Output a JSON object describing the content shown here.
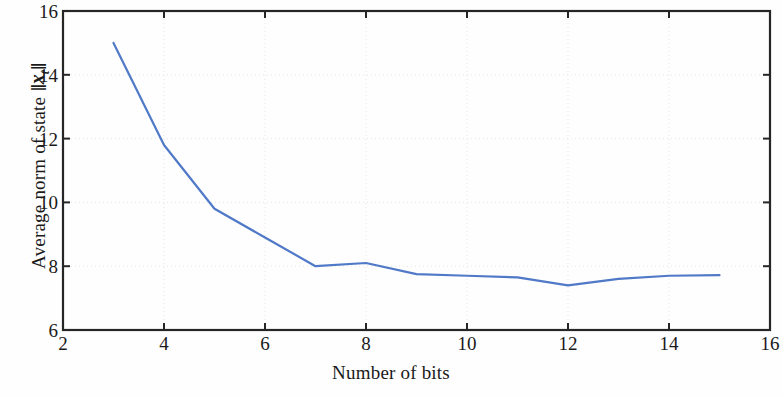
{
  "chart_data": {
    "type": "line",
    "title": "",
    "xlabel": "Number of bits",
    "ylabel": "Average norm of state",
    "ylabel_math": "||x_t||",
    "ylabel_full": "Average norm of state ||x_t||",
    "x": [
      3,
      4,
      5,
      6,
      7,
      8,
      9,
      10,
      11,
      12,
      13,
      14,
      15
    ],
    "values": [
      15.0,
      11.8,
      9.8,
      8.9,
      8.0,
      8.1,
      7.75,
      7.7,
      7.65,
      7.4,
      7.6,
      7.7,
      7.72
    ],
    "series": [
      {
        "name": "Average norm of state",
        "values": [
          15.0,
          11.8,
          9.8,
          8.9,
          8.0,
          8.1,
          7.75,
          7.7,
          7.65,
          7.4,
          7.6,
          7.7,
          7.72
        ]
      }
    ],
    "xlim": [
      2,
      16
    ],
    "ylim": [
      6,
      16
    ],
    "xticks": [
      2,
      4,
      6,
      8,
      10,
      12,
      14,
      16
    ],
    "yticks": [
      6,
      8,
      10,
      12,
      14,
      16
    ],
    "xtick_labels": [
      "2",
      "4",
      "6",
      "8",
      "10",
      "12",
      "14",
      "16"
    ],
    "ytick_labels": [
      "6",
      "8",
      "10",
      "12",
      "14",
      "16"
    ],
    "grid": true,
    "grid_style": "dotted",
    "legend": null,
    "legend_position": "none",
    "line_color": "#5079c8",
    "line_width": 2.2,
    "markers": false,
    "grid_color": "#e6e6e6",
    "axis_color": "#262626",
    "background_color": "#fefefe"
  },
  "axis": {
    "y_title_prefix": "Average norm of state",
    "y_math_var": "x",
    "y_math_sub": "t",
    "x_title": "Number of bits"
  }
}
